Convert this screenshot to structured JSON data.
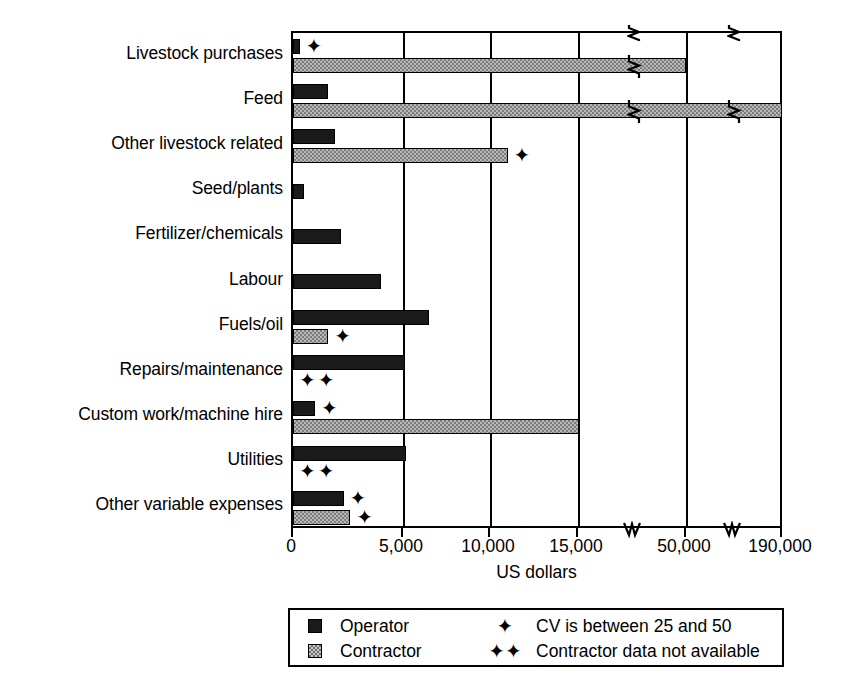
{
  "chart_data": {
    "type": "bar",
    "orientation": "horizontal",
    "title": "",
    "xlabel": "US dollars",
    "ylabel": "",
    "grid": true,
    "legend_position": "bottom",
    "axis_breaks": [
      20000,
      75000
    ],
    "tick_labels": [
      "0",
      "5,000",
      "10,000",
      "15,000",
      "50,000",
      "190,000"
    ],
    "tick_values": [
      0,
      5000,
      10000,
      15000,
      50000,
      190000
    ],
    "xlim": [
      0,
      190000
    ],
    "categories": [
      "Livestock purchases",
      "Feed",
      "Other livestock related",
      "Seed/plants",
      "Fertilizer/chemicals",
      "Labour",
      "Fuels/oil",
      "Repairs/maintenance",
      "Custom work/machine hire",
      "Utilities",
      "Other variable expenses"
    ],
    "series": [
      {
        "name": "Operator",
        "color": "#1a1a1a",
        "values": [
          300,
          1600,
          1900,
          500,
          2200,
          4000,
          6500,
          5100,
          1000,
          5200,
          2300
        ]
      },
      {
        "name": "Contractor",
        "color": "#b8b8b8",
        "values": [
          50000,
          190000,
          11000,
          null,
          null,
          null,
          1600,
          null,
          15400,
          null,
          2600
        ]
      }
    ],
    "markers": {
      "cv_note": "CV is between 25 and 50",
      "unavailable_note": "Contractor data not available",
      "cv_flagged": [
        {
          "category": "Livestock purchases",
          "series": "Operator"
        },
        {
          "category": "Other livestock related",
          "series": "Contractor"
        },
        {
          "category": "Fuels/oil",
          "series": "Contractor"
        },
        {
          "category": "Custom work/machine hire",
          "series": "Operator"
        },
        {
          "category": "Other variable expenses",
          "series": "Operator"
        },
        {
          "category": "Other variable expenses",
          "series": "Contractor"
        }
      ],
      "contractor_unavailable": [
        "Repairs/maintenance",
        "Utilities"
      ]
    }
  },
  "axis": {
    "x_title": "US dollars",
    "ticks": [
      {
        "label": "0",
        "value": 0
      },
      {
        "label": "5,000",
        "value": 5000
      },
      {
        "label": "10,000",
        "value": 10000
      },
      {
        "label": "15,000",
        "value": 15000
      },
      {
        "label": "50,000",
        "value": 50000
      },
      {
        "label": "190,000",
        "value": 190000
      }
    ]
  },
  "categories": [
    "Livestock purchases",
    "Feed",
    "Other livestock related",
    "Seed/plants",
    "Fertilizer/chemicals",
    "Labour",
    "Fuels/oil",
    "Repairs/maintenance",
    "Custom work/machine hire",
    "Utilities",
    "Other variable expenses"
  ],
  "legend": {
    "operator_label": "Operator",
    "contractor_label": "Contractor",
    "cv_symbol": "✦",
    "cv_label": "CV is between 25 and 50",
    "unavailable_symbol": "✦✦",
    "unavailable_label": "Contractor data not available"
  },
  "symbols": {
    "star": "✦"
  }
}
